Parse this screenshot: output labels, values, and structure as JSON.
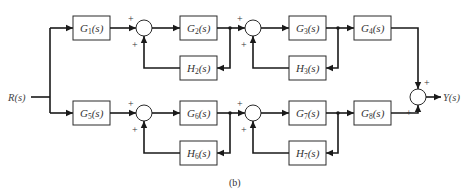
{
  "diagram": {
    "caption": "(b)",
    "input": {
      "label": "R(s)"
    },
    "output": {
      "label": "Y(s)"
    },
    "top_path": {
      "blocks": [
        {
          "id": "G1",
          "name": "G",
          "sub": "1",
          "tail": "(s)"
        },
        {
          "id": "G2",
          "name": "G",
          "sub": "2",
          "tail": "(s)"
        },
        {
          "id": "G3",
          "name": "G",
          "sub": "3",
          "tail": "(s)"
        },
        {
          "id": "G4",
          "name": "G",
          "sub": "4",
          "tail": "(s)"
        }
      ],
      "feedback": [
        {
          "id": "H2",
          "name": "H",
          "sub": "2",
          "tail": "(s)"
        },
        {
          "id": "H3",
          "name": "H",
          "sub": "3",
          "tail": "(s)"
        }
      ],
      "sum_signs": [
        [
          "+",
          "+"
        ],
        [
          "+",
          "+"
        ]
      ]
    },
    "bottom_path": {
      "blocks": [
        {
          "id": "G5",
          "name": "G",
          "sub": "5",
          "tail": "(s)"
        },
        {
          "id": "G6",
          "name": "G",
          "sub": "6",
          "tail": "(s)"
        },
        {
          "id": "G7",
          "name": "G",
          "sub": "7",
          "tail": "(s)"
        },
        {
          "id": "G8",
          "name": "G",
          "sub": "8",
          "tail": "(s)"
        }
      ],
      "feedback": [
        {
          "id": "H6",
          "name": "H",
          "sub": "6",
          "tail": "(s)"
        },
        {
          "id": "H7",
          "name": "H",
          "sub": "7",
          "tail": "(s)"
        }
      ],
      "sum_signs": [
        [
          "+",
          "+"
        ],
        [
          "+",
          "+"
        ]
      ]
    },
    "output_sum_signs": [
      "+",
      "+"
    ]
  }
}
